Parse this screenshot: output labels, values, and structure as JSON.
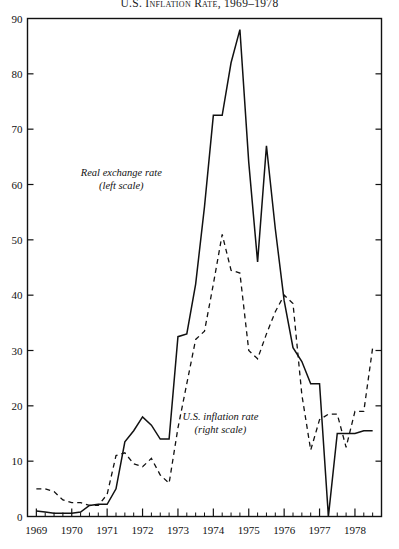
{
  "chart_data": {
    "type": "line",
    "title": "U.S. Inflation Rate, 1969–1978",
    "xlabel": "",
    "ylabel": "",
    "xlim": [
      1968.75,
      1978.75
    ],
    "ylim": [
      0,
      90
    ],
    "grid": false,
    "legend_position": "inline-annotation",
    "y_ticks": [
      0,
      10,
      20,
      30,
      40,
      50,
      60,
      70,
      80,
      90
    ],
    "y_tick_labels": [
      "0",
      "10",
      "20",
      "30",
      "40",
      "50",
      "60",
      "70",
      "80",
      "90"
    ],
    "x_ticks": [
      1969,
      1970,
      1971,
      1972,
      1973,
      1974,
      1975,
      1976,
      1977,
      1978
    ],
    "x_tick_labels": [
      "1969",
      "1970",
      "1971",
      "1972",
      "1973",
      "1974",
      "1975",
      "1976",
      "1977",
      "1978"
    ],
    "x_minor_ticks_per_interval": 3,
    "annotations": [
      {
        "name": "real-exchange-rate",
        "line1": "Real exchange rate",
        "line2": "(left scale)",
        "x": 1971.4,
        "y": 62
      },
      {
        "name": "us-inflation-rate",
        "line1": "U.S. inflation rate",
        "line2": "(right scale)",
        "x": 1974.2,
        "y": 18
      }
    ],
    "series": [
      {
        "name": "Real exchange rate",
        "scale": "left",
        "style": "solid",
        "color": "#111111",
        "x": [
          1969.0,
          1969.25,
          1969.5,
          1969.75,
          1970.0,
          1970.25,
          1970.5,
          1970.75,
          1971.0,
          1971.25,
          1971.5,
          1971.75,
          1972.0,
          1972.25,
          1972.5,
          1972.75,
          1973.0,
          1973.25,
          1973.5,
          1973.75,
          1974.0,
          1974.25,
          1974.5,
          1974.75,
          1975.0,
          1975.25,
          1975.5,
          1975.75,
          1976.0,
          1976.25,
          1976.5,
          1976.75,
          1977.0,
          1977.25,
          1977.5,
          1977.75,
          1978.0,
          1978.25,
          1978.5
        ],
        "values": [
          1.0,
          0.8,
          0.6,
          0.6,
          0.6,
          0.8,
          2.0,
          2.2,
          2.2,
          5.0,
          13.5,
          15.5,
          18.0,
          16.5,
          14.0,
          14.0,
          32.5,
          33.0,
          42.0,
          56.0,
          72.5,
          72.5,
          82.0,
          88.0,
          64.0,
          46.0,
          67.0,
          52.0,
          39.0,
          30.5,
          28.0,
          24.0,
          24.0,
          0.0,
          15.0,
          15.0,
          15.0,
          15.5,
          15.5
        ]
      },
      {
        "name": "U.S. inflation rate",
        "scale": "right",
        "style": "dashed",
        "color": "#111111",
        "x": [
          1969.0,
          1969.25,
          1969.5,
          1969.75,
          1970.0,
          1970.25,
          1970.5,
          1970.75,
          1971.0,
          1971.25,
          1971.5,
          1971.75,
          1972.0,
          1972.25,
          1972.5,
          1972.75,
          1973.0,
          1973.25,
          1973.5,
          1973.75,
          1974.0,
          1974.25,
          1974.5,
          1974.75,
          1975.0,
          1975.25,
          1975.5,
          1975.75,
          1976.0,
          1976.25,
          1976.5,
          1976.75,
          1977.0,
          1977.25,
          1977.5,
          1977.75,
          1978.0,
          1978.25,
          1978.5
        ],
        "values": [
          5.0,
          5.0,
          4.5,
          3.0,
          2.5,
          2.5,
          2.0,
          2.0,
          4.0,
          11.0,
          11.5,
          9.5,
          9.0,
          10.5,
          7.5,
          6.0,
          16.0,
          24.0,
          32.0,
          33.5,
          42.0,
          51.0,
          44.5,
          44.0,
          30.0,
          28.5,
          33.0,
          37.0,
          40.0,
          38.5,
          22.0,
          12.0,
          17.5,
          18.5,
          18.5,
          12.5,
          19.0,
          19.0,
          30.5
        ]
      }
    ]
  }
}
